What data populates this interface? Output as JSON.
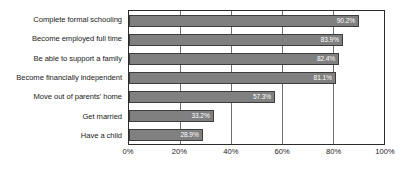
{
  "chart_data": {
    "type": "bar",
    "orientation": "horizontal",
    "title": "",
    "subtitle": "",
    "xlabel": "",
    "ylabel": "",
    "xlim": [
      0,
      100
    ],
    "grid": true,
    "legend": null,
    "categories": [
      "Complete formal schooling",
      "Become employed full time",
      "Be able to support a family",
      "Become financially independent",
      "Move out of parents' home",
      "Get married",
      "Have a child"
    ],
    "values": [
      90.2,
      83.9,
      82.4,
      81.1,
      57.3,
      33.2,
      28.9
    ],
    "data_labels": [
      "90.2%",
      "83.9%",
      "82.4%",
      "81.1%",
      "57.3%",
      "33.2%",
      "28.9%"
    ],
    "tick_values": [
      0,
      20,
      40,
      60,
      80,
      100
    ],
    "tick_labels": [
      "0%",
      "20%",
      "40%",
      "60%",
      "80%",
      "100%"
    ],
    "colors": {
      "bar_fill": "#808080",
      "bar_border": "#3d3d3d",
      "label_text": "#ffffff",
      "axis_text": "#1a1a1a",
      "plot_border": "#2b2b2b",
      "gridline": "#6e6e6e",
      "background": "#ffffff"
    }
  }
}
